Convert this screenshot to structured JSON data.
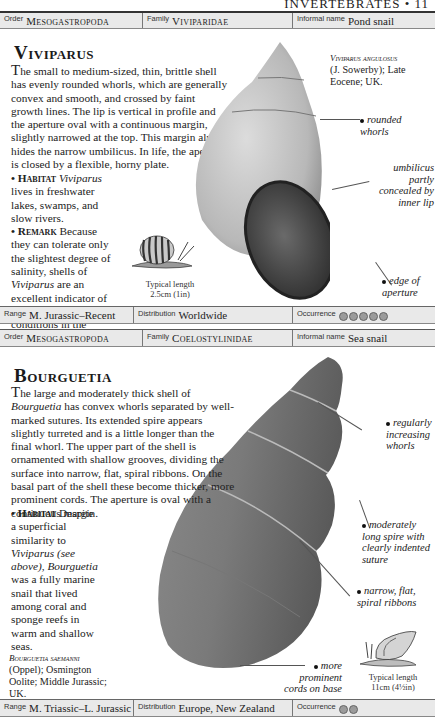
{
  "running_head": "INVERTEBRATES • 11",
  "entries": [
    {
      "order_label": "Order",
      "order": "Mesogastropoda",
      "family_label": "Family",
      "family": "Viviparidae",
      "informal_label": "Informal name",
      "informal": "Pond snail",
      "title": "Viviparus",
      "description": "The small to medium-sized, thin, brittle shell has evenly rounded whorls, which are generally convex and smooth, and crossed by faint growth lines. The lip is vertical in profile and the aperture oval with a continuous margin, slightly narrowed at the top. This margin almost hides the narrow umbilicus. In life, the aperture is closed by a flexible, horny plate.",
      "habitat_label": "• Habitat",
      "habitat_genus": "Viviparus",
      "habitat_text": "lives in freshwater lakes, swamps, and slow rivers.",
      "remark_label": "• Remark",
      "remark_text_1": "Because they can tolerate only the slightest degree of salinity, shells of",
      "remark_genus": "Viviparus",
      "remark_text_2": "are an excellent indicator of non-marine conditions in the fosssil record.",
      "specimen_name": "Viviparus angulosus",
      "specimen_detail": "(J. Sowerby); Late Eocene; UK.",
      "annotations": [
        "rounded whorls",
        "umbilicus partly concealed by inner lip",
        "edge of aperture"
      ],
      "typical_length_label": "Typical length",
      "typical_length": "2.5cm (1in)",
      "range_label": "Range",
      "range": "M. Jurassic–Recent",
      "distribution_label": "Distribution",
      "distribution": "Worldwide",
      "occurrence_label": "Occurrence",
      "occurrence_count": 5
    },
    {
      "order_label": "Order",
      "order": "Mesogastropoda",
      "family_label": "Family",
      "family": "Coelostylinidae",
      "informal_label": "Informal name",
      "informal": "Sea snail",
      "title": "Bourguetia",
      "description_1": "The large and moderately thick shell of",
      "description_genus": "Bourguetia",
      "description_2": "has convex whorls separated by well-marked sutures. Its extended spire appears slightly turreted and is a little longer than the final whorl. The upper part of the shell is ornamented with shallow grooves, dividing the surface into narrow, flat, spiral ribbons. On the basal part of the shell these become thicker, more prominent cords. The aperture is oval with a continuous margin.",
      "habitat_label": "• Habitat",
      "habitat_text_1": "Despite a superficial similarity to",
      "habitat_ref": "Viviparus (see above), Bourguetia",
      "habitat_text_2": "was a fully marine snail that lived among coral and sponge reefs in warm and shallow seas.",
      "specimen_name": "Bourguetia saemanni",
      "specimen_detail": "(Oppel); Osmington Oolite; Middle Jurassic; UK.",
      "annotations": [
        "regularly increasing whorls",
        "moderately long spire with clearly indented suture",
        "narrow, flat, spiral ribbons",
        "more prominent cords on base"
      ],
      "typical_length_label": "Typical length",
      "typical_length": "11cm (4½in)",
      "range_label": "Range",
      "range": "M. Triassic–L. Jurassic",
      "distribution_label": "Distribution",
      "distribution": "Europe, New Zealand",
      "occurrence_label": "Occurrence",
      "occurrence_count": 2
    }
  ]
}
